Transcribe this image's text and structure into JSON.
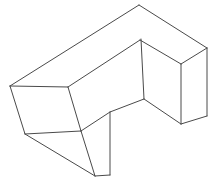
{
  "figure": {
    "kind": "line-drawing",
    "background_color": "#ffffff",
    "stroke_color": "#4a4a4a",
    "stroke_width": 1,
    "canvas": {
      "width": 217,
      "height": 184
    },
    "vertices": {
      "top_left": [
        10,
        86
      ],
      "top_apex": [
        139,
        5
      ],
      "top_right": [
        207,
        48
      ],
      "notch_left": [
        68,
        87
      ],
      "notch_apex": [
        140,
        40
      ],
      "notch_right": [
        181,
        64
      ],
      "inner_vertical_top": [
        141,
        39
      ],
      "inner_vertical_bottom": [
        144,
        99
      ],
      "front_left_bottom": [
        25,
        134
      ],
      "front_mid": [
        81,
        131
      ],
      "front_bottom": [
        95,
        176
      ],
      "front_right_bottom": [
        110,
        175
      ],
      "front_right_top": [
        110,
        112
      ],
      "right_inner_bottom": [
        181,
        124
      ],
      "right_far_bottom": [
        207,
        116
      ]
    },
    "edges": [
      {
        "name": "top-back-left",
        "from": [
          10,
          86
        ],
        "to": [
          139,
          5
        ]
      },
      {
        "name": "top-back-right",
        "from": [
          139,
          5
        ],
        "to": [
          207,
          48
        ]
      },
      {
        "name": "top-inner-left",
        "from": [
          10,
          86
        ],
        "to": [
          68,
          87
        ]
      },
      {
        "name": "notch-inner-up",
        "from": [
          68,
          87
        ],
        "to": [
          140,
          40
        ]
      },
      {
        "name": "notch-inner-right",
        "from": [
          140,
          40
        ],
        "to": [
          181,
          64
        ]
      },
      {
        "name": "top-right-edge",
        "from": [
          207,
          48
        ],
        "to": [
          181,
          64
        ]
      },
      {
        "name": "inner-vertical-left",
        "from": [
          141,
          39
        ],
        "to": [
          144,
          99
        ]
      },
      {
        "name": "inner-face-diagonal",
        "from": [
          144,
          99
        ],
        "to": [
          181,
          124
        ]
      },
      {
        "name": "inner-face-left-diagonal",
        "from": [
          144,
          99
        ],
        "to": [
          110,
          112
        ]
      },
      {
        "name": "inner-vertical-right",
        "from": [
          181,
          64
        ],
        "to": [
          181,
          124
        ]
      },
      {
        "name": "right-vertical",
        "from": [
          207,
          48
        ],
        "to": [
          207,
          116
        ]
      },
      {
        "name": "right-bottom-edge",
        "from": [
          181,
          124
        ],
        "to": [
          207,
          116
        ]
      },
      {
        "name": "left-vertical",
        "from": [
          10,
          86
        ],
        "to": [
          25,
          134
        ]
      },
      {
        "name": "front-left-bottom-edge",
        "from": [
          25,
          134
        ],
        "to": [
          95,
          176
        ]
      },
      {
        "name": "front-notch-diagonal",
        "from": [
          68,
          87
        ],
        "to": [
          81,
          131
        ]
      },
      {
        "name": "front-mid-diagonal",
        "from": [
          81,
          131
        ],
        "to": [
          95,
          176
        ]
      },
      {
        "name": "front-upper-edge",
        "from": [
          25,
          134
        ],
        "to": [
          81,
          131
        ]
      },
      {
        "name": "front-bottom-edge",
        "from": [
          95,
          176
        ],
        "to": [
          110,
          175
        ]
      },
      {
        "name": "front-right-vertical",
        "from": [
          110,
          112
        ],
        "to": [
          110,
          175
        ]
      },
      {
        "name": "front-top-to-notch",
        "from": [
          81,
          131
        ],
        "to": [
          110,
          112
        ]
      }
    ]
  }
}
